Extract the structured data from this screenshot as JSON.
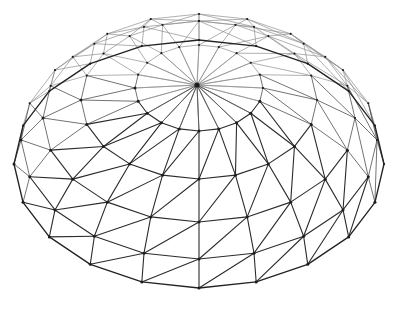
{
  "figure": {
    "name": "geodesic-dome-wireframe",
    "title": "Geodesic Dome Wireframe",
    "background_color": "#ffffff",
    "canvas": {
      "width": 401,
      "height": 311
    }
  },
  "render": {
    "apex": {
      "x": 197,
      "y": 85
    },
    "center": {
      "x": 199,
      "y": 158
    },
    "meridians": 20,
    "rings": 5,
    "squash": 0.74,
    "tilt_shift": 0.0,
    "stroke_widths": {
      "back": 0.7,
      "mid": 0.85,
      "front": 1.1,
      "rim": 1.35
    },
    "colors": {
      "back": "#8e8e8e",
      "mid": "#5a5a5a",
      "front": "#2b2b2b",
      "rim": "#232323",
      "vertex": "#1d1d1d"
    }
  },
  "chart_data": {
    "type": "scatter",
    "title": "Geodesic Dome Wireframe",
    "xlabel": "",
    "ylabel": "",
    "grid": false,
    "legend": null,
    "projection": {
      "type": "orthographic-oblique",
      "vertical_squash": 0.74,
      "apex_screen": [
        197,
        85
      ],
      "ellipse_center_screen": [
        199,
        158
      ]
    },
    "rings": [
      {
        "index": 0,
        "name": "apex",
        "vertices": 1,
        "rx": 0,
        "ry": 0,
        "cy": 85,
        "elevation_deg": 90
      },
      {
        "index": 1,
        "name": "ring-1",
        "vertices": 20,
        "rx": 64,
        "ry": 43,
        "cy": 88,
        "elevation_deg": 66
      },
      {
        "index": 2,
        "name": "ring-2",
        "vertices": 20,
        "rx": 118,
        "ry": 79,
        "cy": 100,
        "elevation_deg": 45
      },
      {
        "index": 3,
        "name": "ring-3",
        "vertices": 20,
        "rx": 156,
        "ry": 104,
        "cy": 118,
        "elevation_deg": 26
      },
      {
        "index": 4,
        "name": "ring-4",
        "vertices": 20,
        "rx": 178,
        "ry": 119,
        "cy": 140,
        "elevation_deg": 12
      },
      {
        "index": 5,
        "name": "rim",
        "vertices": 20,
        "rx": 185,
        "ry": 124,
        "cy": 164,
        "elevation_deg": 0
      }
    ],
    "edge_classes": [
      {
        "name": "meridian",
        "count": 100,
        "description": "radial struts joining a vertex on one ring to the matching vertex on the next ring out"
      },
      {
        "name": "latitude",
        "count": 100,
        "description": "ring chords connecting neighbouring vertices within the same latitude ring"
      },
      {
        "name": "diagonal",
        "count": 100,
        "description": "zigzag bracing from ring N vertex i to ring N+1 vertex i+1"
      }
    ],
    "counts": {
      "vertices": 101,
      "edges": 300,
      "triangular_faces": 200
    }
  }
}
